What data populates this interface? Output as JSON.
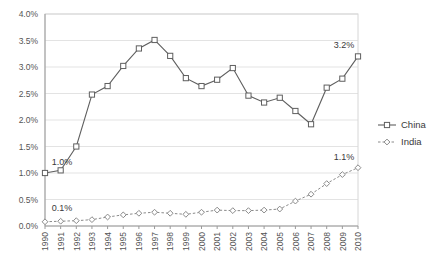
{
  "chart_data": {
    "type": "line",
    "title": "",
    "xlabel": "",
    "ylabel": "",
    "ylim": [
      0.0,
      4.0
    ],
    "ytick_labels": [
      "0.0%",
      "0.5%",
      "1.0%",
      "1.5%",
      "2.0%",
      "2.5%",
      "3.0%",
      "3.5%",
      "4.0%"
    ],
    "ytick_values": [
      0.0,
      0.5,
      1.0,
      1.5,
      2.0,
      2.5,
      3.0,
      3.5,
      4.0
    ],
    "grid": true,
    "legend_position": "right",
    "categories": [
      "1990",
      "1991",
      "1992",
      "1993",
      "1994",
      "1995",
      "1996",
      "1997",
      "1998",
      "1999",
      "2000",
      "2001",
      "2002",
      "2003",
      "2004",
      "2005",
      "2006",
      "2007",
      "2008",
      "2009",
      "2010"
    ],
    "series": [
      {
        "name": "China",
        "marker": "square",
        "linestyle": "solid",
        "color": "#5f5f5f",
        "values": [
          1.0,
          1.05,
          1.5,
          2.48,
          2.64,
          3.02,
          3.35,
          3.51,
          3.21,
          2.79,
          2.64,
          2.76,
          2.98,
          2.46,
          2.33,
          2.42,
          2.17,
          1.92,
          2.61,
          2.78,
          3.2
        ]
      },
      {
        "name": "India",
        "marker": "diamond",
        "linestyle": "dashed",
        "color": "#8a8a8a",
        "values": [
          0.08,
          0.09,
          0.1,
          0.12,
          0.17,
          0.21,
          0.24,
          0.26,
          0.24,
          0.22,
          0.26,
          0.3,
          0.29,
          0.29,
          0.3,
          0.32,
          0.47,
          0.6,
          0.8,
          0.97,
          1.1
        ]
      }
    ],
    "annotations": [
      {
        "label": "1.0%",
        "series": "China",
        "category": "1990"
      },
      {
        "label": "0.1%",
        "series": "India",
        "category": "1990"
      },
      {
        "label": "3.2%",
        "series": "China",
        "category": "2010"
      },
      {
        "label": "1.1%",
        "series": "India",
        "category": "2010"
      }
    ]
  },
  "legend": {
    "items": [
      {
        "label": "China"
      },
      {
        "label": "India"
      }
    ]
  }
}
